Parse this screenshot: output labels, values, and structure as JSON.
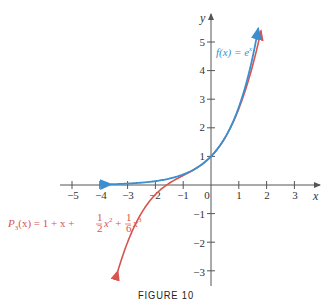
{
  "chart_data": {
    "type": "line",
    "title": "",
    "caption": "FIGURE 10",
    "xlabel": "x",
    "ylabel": "y",
    "xlim": [
      -5.3,
      3.6
    ],
    "ylim": [
      -3.5,
      5.8
    ],
    "x_ticks": [
      -5,
      -4,
      -3,
      -2,
      -1,
      0,
      1,
      2,
      3
    ],
    "y_ticks": [
      -3,
      -2,
      -1,
      1,
      2,
      3,
      4,
      5
    ],
    "grid": false,
    "series": [
      {
        "name": "f(x) = e^x",
        "label_text": "f(x) = e",
        "label_sup": "x",
        "color": "#3a8fd0",
        "function": "exp(x)",
        "x_range": [
          -3.6,
          1.7
        ],
        "x": [
          -3.6,
          -3,
          -2,
          -1,
          0,
          0.5,
          1,
          1.5,
          1.7
        ],
        "values": [
          0.03,
          0.05,
          0.14,
          0.37,
          1.0,
          1.65,
          2.72,
          4.48,
          5.47
        ]
      },
      {
        "name": "P3(x) = 1 + x + 1/2 x^2 + 1/6 x^3",
        "color": "#d9534f",
        "function": "1 + x + x^2/2 + x^3/6",
        "x_range": [
          -3.35,
          1.8
        ],
        "x": [
          -3.35,
          -3,
          -2,
          -1,
          0,
          1,
          1.5,
          1.8
        ],
        "values": [
          -2.99,
          -2.0,
          -0.33,
          0.33,
          1.0,
          2.67,
          4.19,
          5.06
        ]
      }
    ],
    "legend": "inline labels"
  },
  "labels": {
    "x_axis": "x",
    "y_axis": "y",
    "origin": "0",
    "x_ticks": [
      "−5",
      "−4",
      "−3",
      "−2",
      "−1",
      "1",
      "2",
      "3"
    ],
    "y_ticks": [
      "5",
      "4",
      "3",
      "2",
      "1",
      "−1",
      "−2",
      "−3"
    ],
    "f_label_main": "f(x) = e",
    "f_label_sup": "x",
    "p_label": {
      "P": "P",
      "sub": "3",
      "rest1": "(x) = 1 + x + ",
      "frac1_num": "1",
      "frac1_den": "2",
      "x2": "x",
      "sup2": "2",
      "plus": " + ",
      "frac2_num": "1",
      "frac2_den": "6",
      "x3": "x",
      "sup3": "3"
    },
    "caption": "FIGURE 10"
  },
  "colors": {
    "blue": "#3a8fd0",
    "red": "#d9534f",
    "axis": "#555555"
  }
}
